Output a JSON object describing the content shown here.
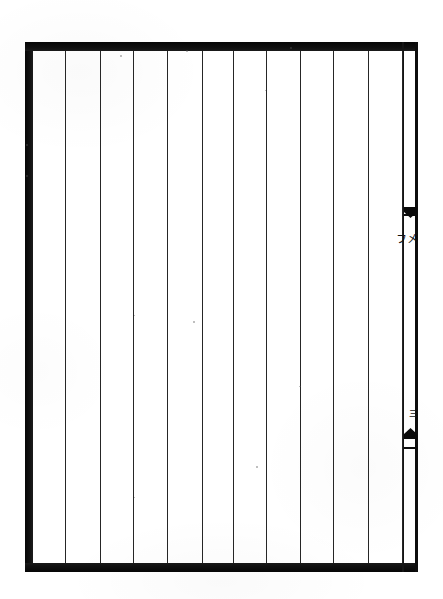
{
  "document": {
    "kind": "scanned-page",
    "title": "Blank ruled page from a woodblock-printed book",
    "page_width": 443,
    "page_height": 599,
    "paper_color": "#ffffff",
    "ink_color": "#0a0a0a",
    "rule_color": "#262626"
  },
  "frame": {
    "name": "block-border",
    "left": 25,
    "top": 42,
    "width": 393,
    "height": 530,
    "thick_rule_px": 9,
    "thin_inner_rule_px": 2,
    "description": "Heavy double border enclosing the text block"
  },
  "columns": {
    "count": 12,
    "rule_count": 11,
    "rule_positions_x": [
      65,
      100,
      133,
      167,
      202,
      233,
      266,
      300,
      333,
      368,
      402
    ],
    "rule_top_y": 51,
    "rule_bottom_y": 563,
    "content": [
      "",
      "",
      "",
      "",
      "",
      "",
      "",
      "",
      "",
      "",
      "",
      ""
    ],
    "note": "All writing columns are empty"
  },
  "centre_strip": {
    "name": "banxin",
    "left": 379,
    "top": 51,
    "width": 11,
    "height": 512,
    "markers": [
      {
        "name": "fishtail-upper",
        "glyph": "fish-tail-mark",
        "direction": "down",
        "y": 207
      },
      {
        "name": "fishtail-lower",
        "glyph": "fish-tail-mark",
        "direction": "up",
        "y": 428
      }
    ],
    "upper_text": "㐅\nフ",
    "lower_text": "三",
    "upper_text_label": "upper fold inscription",
    "lower_text_label": "lower fold inscription"
  },
  "specks": [
    {
      "x": 120,
      "y": 55,
      "size": 2
    },
    {
      "x": 186,
      "y": 50,
      "size": 2
    },
    {
      "x": 290,
      "y": 47,
      "size": 2
    },
    {
      "x": 265,
      "y": 90,
      "size": 1
    },
    {
      "x": 193,
      "y": 321,
      "size": 2
    },
    {
      "x": 134,
      "y": 315,
      "size": 1
    },
    {
      "x": 299,
      "y": 386,
      "size": 1
    },
    {
      "x": 256,
      "y": 466,
      "size": 2
    },
    {
      "x": 134,
      "y": 497,
      "size": 1
    },
    {
      "x": 300,
      "y": 386,
      "size": 1
    },
    {
      "x": 26,
      "y": 144,
      "size": 2
    },
    {
      "x": 26,
      "y": 175,
      "size": 2
    }
  ]
}
